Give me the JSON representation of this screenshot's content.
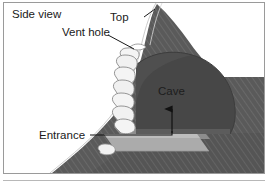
{
  "figure": {
    "panel_title": "Side view",
    "background_color": "#ffffff",
    "frame_color": "#9a9a9a"
  },
  "labels": {
    "side_view": "Side view",
    "top": "Top",
    "vent_hole": "Vent hole",
    "cave": "Cave",
    "entrance": "Entrance"
  },
  "colors": {
    "hillside_fill": "#5a5a5a",
    "hillside_hatch": "#6e6e6e",
    "cave_fill": "#4a4a4a",
    "ramp_fill": "#a8a8a8",
    "ramp_shadow": "#8d8d8d",
    "boulder_fill": "#f2f2f2",
    "boulder_stroke": "#8a8a8a",
    "outline_white": "#ffffff",
    "leader_line": "#1a1a1a",
    "text": "#1a1a1a"
  },
  "elements": {
    "hillside_name": "hillside-cross-section",
    "cave_name": "cave-chamber",
    "ramp_name": "entrance-ramp",
    "boulders_name": "cave-wall-boulders",
    "vent_name": "vent-hole-opening"
  }
}
